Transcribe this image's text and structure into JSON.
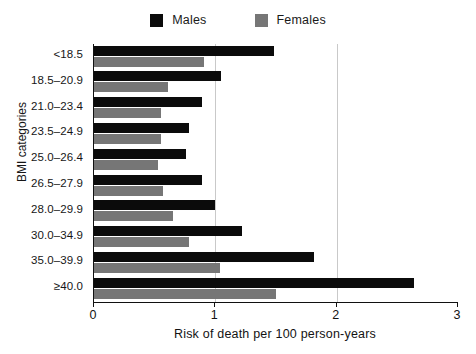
{
  "legend": {
    "entries": [
      {
        "label": "Males",
        "color": "#0b0b0b",
        "swatch": "legend-swatch-males"
      },
      {
        "label": "Females",
        "color": "#767676",
        "swatch": "legend-swatch-females"
      }
    ]
  },
  "axes": {
    "y_title": "BMI categories",
    "x_title": "Risk of death per 100 person-years",
    "x_ticks": [
      "0",
      "1",
      "2",
      "3"
    ]
  },
  "chart_data": {
    "type": "bar",
    "orientation": "horizontal",
    "title": "",
    "xlabel": "Risk of death per 100 person-years",
    "ylabel": "BMI categories",
    "xlim": [
      0,
      3
    ],
    "xticks": [
      0,
      1,
      2,
      3
    ],
    "grid": "vertical gridlines at x = 1 and x = 2",
    "legend_position": "top-center",
    "categories": [
      "<18.5",
      "18.5–20.9",
      "21.0–23.4",
      "23.5–24.9",
      "25.0–26.4",
      "26.5–27.9",
      "28.0–29.9",
      "30.0–34.9",
      "35.0–39.9",
      "≥40.0"
    ],
    "series": [
      {
        "name": "Males",
        "color": "#0b0b0b",
        "values": [
          1.48,
          1.05,
          0.89,
          0.78,
          0.76,
          0.89,
          1.0,
          1.22,
          1.81,
          2.64
        ]
      },
      {
        "name": "Females",
        "color": "#767676",
        "values": [
          0.91,
          0.61,
          0.55,
          0.55,
          0.53,
          0.57,
          0.65,
          0.78,
          1.04,
          1.5
        ]
      }
    ]
  }
}
